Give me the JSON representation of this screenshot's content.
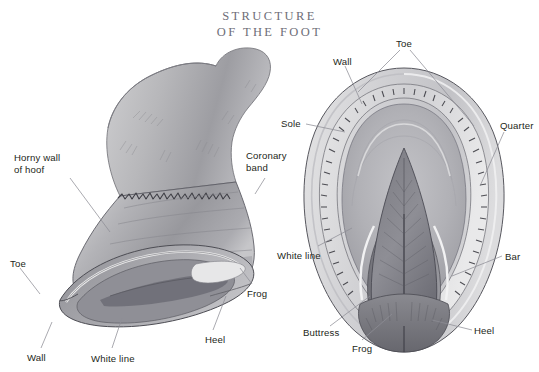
{
  "title": {
    "line1": "Structure",
    "line2": "of the Foot",
    "color": "#6e6e77"
  },
  "page": {
    "background": "#ffffff",
    "width": 539,
    "height": 372,
    "label_color": "#241f20",
    "leader_color": "#8d8d95",
    "ink_color": "#3a3a3e"
  },
  "figures": [
    {
      "name": "lateral-hoof-view",
      "caption": "Side view of horse hoof and pastern"
    },
    {
      "name": "sole-hoof-view",
      "caption": "Underside (sole) view of horse hoof"
    }
  ],
  "labels": [
    {
      "id": "horny-wall-of-hoof",
      "text": "Horny wall\nof hoof",
      "x": 14,
      "y": 152,
      "figure": "lateral-hoof-view"
    },
    {
      "id": "toe-left",
      "text": "Toe",
      "x": 10,
      "y": 258,
      "figure": "lateral-hoof-view"
    },
    {
      "id": "wall-left",
      "text": "Wall",
      "x": 27,
      "y": 352,
      "figure": "lateral-hoof-view"
    },
    {
      "id": "white-line-left",
      "text": "White line",
      "x": 91,
      "y": 353,
      "figure": "lateral-hoof-view"
    },
    {
      "id": "heel-left",
      "text": "Heel",
      "x": 205,
      "y": 334,
      "figure": "lateral-hoof-view"
    },
    {
      "id": "frog-left",
      "text": "Frog",
      "x": 247,
      "y": 288,
      "figure": "lateral-hoof-view"
    },
    {
      "id": "coronary-band",
      "text": "Coronary\nband",
      "x": 246,
      "y": 150,
      "figure": "lateral-hoof-view"
    },
    {
      "id": "sole-right",
      "text": "Sole",
      "x": 281,
      "y": 118,
      "figure": "sole-hoof-view"
    },
    {
      "id": "wall-right",
      "text": "Wall",
      "x": 333,
      "y": 56,
      "figure": "sole-hoof-view"
    },
    {
      "id": "toe-right",
      "text": "Toe",
      "x": 396,
      "y": 38,
      "figure": "sole-hoof-view"
    },
    {
      "id": "quarter-right",
      "text": "Quarter",
      "x": 500,
      "y": 120,
      "figure": "sole-hoof-view"
    },
    {
      "id": "white-line-right",
      "text": "White line",
      "x": 277,
      "y": 250,
      "figure": "sole-hoof-view"
    },
    {
      "id": "bar-right",
      "text": "Bar",
      "x": 505,
      "y": 251,
      "figure": "sole-hoof-view"
    },
    {
      "id": "heel-right",
      "text": "Heel",
      "x": 474,
      "y": 325,
      "figure": "sole-hoof-view"
    },
    {
      "id": "buttress-right",
      "text": "Buttress",
      "x": 303,
      "y": 327,
      "figure": "sole-hoof-view"
    },
    {
      "id": "frog-right",
      "text": "Frog",
      "x": 352,
      "y": 343,
      "figure": "sole-hoof-view"
    }
  ]
}
